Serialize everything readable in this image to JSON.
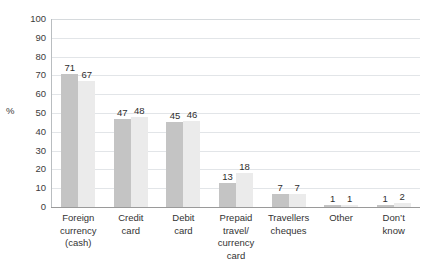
{
  "chart_data": {
    "type": "bar",
    "title": "",
    "xlabel": "",
    "ylabel": "%",
    "ylim": [
      0,
      100
    ],
    "ystep": 10,
    "yticks": [
      "100",
      "90",
      "80",
      "70",
      "60",
      "50",
      "40",
      "30",
      "20",
      "10",
      "0"
    ],
    "grid": true,
    "legend": "none",
    "categories": [
      "Foreign\ncurrency\n(cash)",
      "Credit\ncard",
      "Debit\ncard",
      "Prepaid\ntravel/\ncurrency\ncard",
      "Travellers\ncheques",
      "Other",
      "Don’t\nknow"
    ],
    "series": [
      {
        "name": "series-1",
        "color": "#c4c4c4",
        "values": [
          71,
          47,
          45,
          13,
          7,
          1,
          1
        ],
        "labels": [
          "71",
          "47",
          "45",
          "13",
          "7",
          "1",
          "1"
        ]
      },
      {
        "name": "series-2",
        "color": "#ebebeb",
        "values": [
          67,
          48,
          46,
          18,
          7,
          1,
          2
        ],
        "labels": [
          "67",
          "48",
          "46",
          "18",
          "7",
          "1",
          "2"
        ]
      }
    ]
  }
}
